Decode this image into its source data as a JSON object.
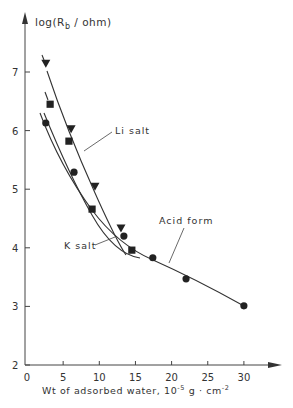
{
  "chart_data": {
    "type": "scatter",
    "title": "",
    "ylabel": "log(R_b / ohm)",
    "ylabel_main": "log(R",
    "ylabel_sub": "b",
    "ylabel_tail": " / ohm)",
    "xlabel": "Wt of adsorbed water, 10^-5 g·cm^-2",
    "xlabel_main": "Wt of adsorbed water,  10",
    "xlabel_exp1": "-5",
    "xlabel_mid": " g · cm",
    "xlabel_exp2": "-2",
    "xlim": [
      0,
      33
    ],
    "ylim": [
      2,
      7.5
    ],
    "xticks": [
      0,
      5,
      10,
      15,
      20,
      25,
      30
    ],
    "yticks": [
      2,
      3,
      4,
      5,
      6,
      7
    ],
    "grid": false,
    "legend": "inline labels",
    "series": [
      {
        "name": "Li salt",
        "marker": "triangle-down",
        "x": [
          2.6,
          6.1,
          9.4,
          13.0
        ],
        "y": [
          7.15,
          6.03,
          5.05,
          4.34
        ]
      },
      {
        "name": "K salt",
        "marker": "square",
        "x": [
          3.2,
          5.8,
          9.0,
          14.5
        ],
        "y": [
          6.45,
          5.82,
          4.66,
          3.96
        ]
      },
      {
        "name": "Acid form",
        "marker": "circle",
        "x": [
          2.6,
          6.5,
          13.4,
          17.4,
          22.0,
          30.0
        ],
        "y": [
          6.13,
          5.29,
          4.2,
          3.83,
          3.47,
          3.01
        ]
      }
    ],
    "annotations": [
      {
        "text": "Li salt",
        "series": "Li salt"
      },
      {
        "text": "K salt",
        "series": "K salt"
      },
      {
        "text": "Acid form",
        "series": "Acid form"
      }
    ],
    "colors": {
      "ink": "#333333",
      "background": "#ffffff"
    }
  }
}
